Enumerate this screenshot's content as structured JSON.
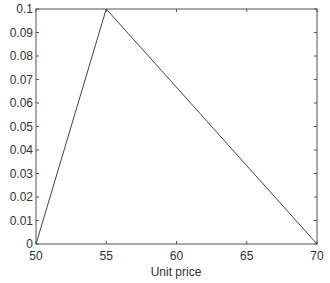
{
  "chart_data": {
    "type": "line",
    "title": "",
    "xlabel": "Unit price",
    "ylabel": "",
    "xlim": [
      50,
      70
    ],
    "ylim": [
      0,
      0.1
    ],
    "grid": false,
    "legend": null,
    "x_ticks": [
      "50",
      "55",
      "60",
      "65",
      "70"
    ],
    "y_ticks": [
      "0",
      "0.01",
      "0.02",
      "0.03",
      "0.04",
      "0.05",
      "0.06",
      "0.07",
      "0.08",
      "0.09",
      "0.1"
    ],
    "series": [
      {
        "name": "triangular membership",
        "x": [
          50,
          55,
          70
        ],
        "y": [
          0,
          0.1,
          0
        ],
        "color": "#444444"
      }
    ]
  }
}
